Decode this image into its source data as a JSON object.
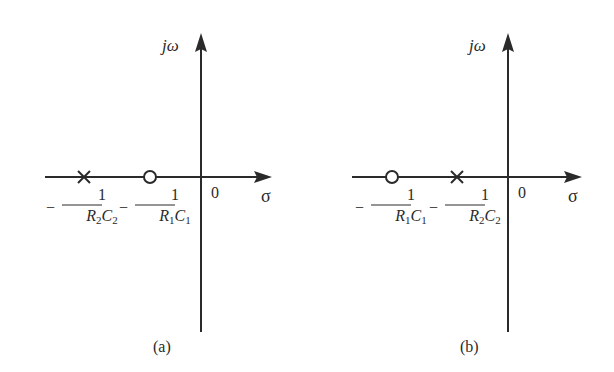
{
  "figure": {
    "type": "pole-zero plot (s-plane)",
    "colors": {
      "ink": "#2a2a2a",
      "background": "#ffffff"
    },
    "panels": [
      {
        "id": "a",
        "caption": "(a)",
        "vertical_axis_label": "jω",
        "horizontal_axis_label": "σ",
        "origin_label": "0",
        "markers": [
          {
            "kind": "pole",
            "symbol": "×",
            "label_sign": "−",
            "label_numerator": "1",
            "label_denominator": {
              "R": "R",
              "R_sub": "2",
              "C": "C",
              "C_sub": "2"
            },
            "label_text": "−1/(R2C2)"
          },
          {
            "kind": "zero",
            "symbol": "○",
            "label_sign": "−",
            "label_numerator": "1",
            "label_denominator": {
              "R": "R",
              "R_sub": "1",
              "C": "C",
              "C_sub": "1"
            },
            "label_text": "−1/(R1C1)"
          }
        ]
      },
      {
        "id": "b",
        "caption": "(b)",
        "vertical_axis_label": "jω",
        "horizontal_axis_label": "σ",
        "origin_label": "0",
        "markers": [
          {
            "kind": "zero",
            "symbol": "○",
            "label_sign": "−",
            "label_numerator": "1",
            "label_denominator": {
              "R": "R",
              "R_sub": "1",
              "C": "C",
              "C_sub": "1"
            },
            "label_text": "−1/(R1C1)"
          },
          {
            "kind": "pole",
            "symbol": "×",
            "label_sign": "−",
            "label_numerator": "1",
            "label_denominator": {
              "R": "R",
              "R_sub": "2",
              "C": "C",
              "C_sub": "2"
            },
            "label_text": "−1/(R2C2)"
          }
        ]
      }
    ]
  }
}
